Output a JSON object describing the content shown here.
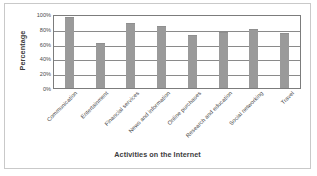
{
  "chart_data": {
    "type": "bar",
    "title": "",
    "xlabel": "Activities on the Internet",
    "ylabel": "Percentage",
    "categories": [
      "Communication",
      "Entertainment",
      "Financial services",
      "News and information",
      "Online purchases",
      "Research and education",
      "Social networking",
      "Travel"
    ],
    "values": [
      96,
      61,
      88,
      84,
      72,
      76,
      80,
      75
    ],
    "ylim": [
      0,
      100
    ],
    "yticks": [
      0,
      20,
      40,
      60,
      80,
      100
    ],
    "ytick_labels": [
      "0%",
      "20%",
      "40%",
      "60%",
      "80%",
      "100%"
    ],
    "grid": true,
    "legend": "none",
    "bar_color": "#9a9a9a",
    "axis_color": "#7c7c7c",
    "frame_color": "#c9c9c9"
  }
}
